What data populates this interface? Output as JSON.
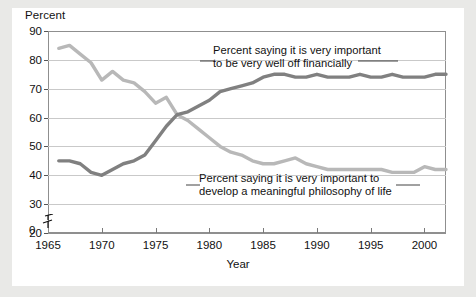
{
  "chart_data": {
    "type": "line",
    "title": "",
    "ylabel": "Percent",
    "xlabel": "Year",
    "ylim": [
      20,
      90
    ],
    "xlim": [
      1965,
      2002
    ],
    "grid": true,
    "legend_position": "annotations-inline",
    "y_axis_break": true,
    "y_axis_break_note": "axis broken between 0 and 20",
    "yticks": [
      90,
      80,
      70,
      60,
      50,
      40,
      30,
      20,
      0
    ],
    "xticks": [
      1965,
      1970,
      1975,
      1980,
      1985,
      1990,
      1995,
      2000
    ],
    "x": [
      1966,
      1967,
      1968,
      1969,
      1970,
      1971,
      1972,
      1973,
      1974,
      1975,
      1976,
      1977,
      1978,
      1979,
      1980,
      1981,
      1982,
      1983,
      1984,
      1985,
      1986,
      1987,
      1988,
      1989,
      1990,
      1991,
      1992,
      1993,
      1994,
      1995,
      1996,
      1997,
      1998,
      1999,
      2000,
      2001,
      2002
    ],
    "series": [
      {
        "name": "Percent saying it is very important to be very well off financially",
        "color": "#808080",
        "values": [
          45,
          45,
          44,
          41,
          40,
          42,
          44,
          45,
          47,
          52,
          57,
          61,
          62,
          64,
          66,
          69,
          70,
          71,
          72,
          74,
          75,
          75,
          74,
          74,
          75,
          74,
          74,
          74,
          75,
          74,
          74,
          75,
          74,
          74,
          74,
          75,
          75
        ]
      },
      {
        "name": "Percent saying it is very important to develop a meaningful philosophy of life",
        "color": "#b8b8b8",
        "values": [
          84,
          85,
          82,
          79,
          73,
          76,
          73,
          72,
          69,
          65,
          67,
          61,
          59,
          56,
          53,
          50,
          48,
          47,
          45,
          44,
          44,
          45,
          46,
          44,
          43,
          42,
          42,
          42,
          42,
          42,
          42,
          41,
          41,
          41,
          43,
          42,
          42
        ]
      }
    ],
    "annotations": [
      {
        "id": "annotation-financial",
        "text": "Percent saying it is very important\nto be very well off financially",
        "series": "Percent saying it is very important to be very well off financially"
      },
      {
        "id": "annotation-philosophy",
        "text": "Percent saying it is very important to\ndevelop a meaningful philosophy of life",
        "series": "Percent saying it is very important to develop a meaningful philosophy of life"
      }
    ]
  },
  "axes": {
    "y_title": "Percent",
    "x_title": "Year",
    "y_tick_labels": [
      "90",
      "80",
      "70",
      "60",
      "50",
      "40",
      "30",
      "20"
    ],
    "zero_label": "0",
    "x_tick_labels": [
      "1965",
      "1970",
      "1975",
      "1980",
      "1985",
      "1990",
      "1995",
      "2000"
    ]
  },
  "colors": {
    "page_background": "#e9e9e7",
    "plot_background": "#ffffff",
    "gridline": "#c9c9c9",
    "frame": "#8f8f8f",
    "series_dark": "#808080",
    "series_light": "#b8b8b8",
    "text": "#111111"
  }
}
